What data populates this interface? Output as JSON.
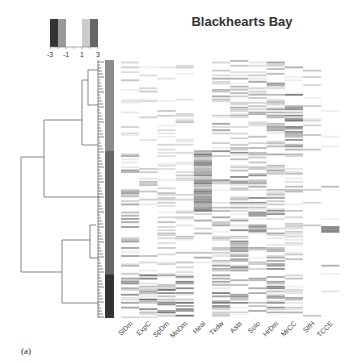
{
  "figure_label": "(a)",
  "chart_data": {
    "type": "heatmap",
    "title": "Blackhearts Bay",
    "columns": [
      "SlDm",
      "ExpC",
      "SpDm",
      "MnDm",
      "Heal",
      "Tkdw",
      "Asts",
      "Solo",
      "HrDm",
      "MrCC",
      "SlfH",
      "TCCE"
    ],
    "legend": {
      "type": "color-key",
      "ticks": [
        "-3",
        "-1",
        "1",
        "3"
      ],
      "range": [
        -3,
        3
      ],
      "bins": [
        {
          "from": -3,
          "to": -2,
          "color": "#333333"
        },
        {
          "from": -2,
          "to": -1,
          "color": "#999999"
        },
        {
          "from": -1,
          "to": 1,
          "color": "#ffffff"
        },
        {
          "from": 1,
          "to": 2,
          "color": "#cccccc"
        },
        {
          "from": 2,
          "to": 3,
          "color": "#666666"
        }
      ],
      "placement": "top-left"
    },
    "row_clusters": [
      {
        "name": "cluster-1",
        "color": "#8c8c8c",
        "row_fraction": 0.35
      },
      {
        "name": "cluster-2",
        "color": "#666666",
        "row_fraction": 0.48
      },
      {
        "name": "cluster-3",
        "color": "#333333",
        "row_fraction": 0.17
      }
    ],
    "row_dendrogram": true,
    "n_rows": 160,
    "cell_scale": "grayscale (white = 0, darker = higher)"
  }
}
